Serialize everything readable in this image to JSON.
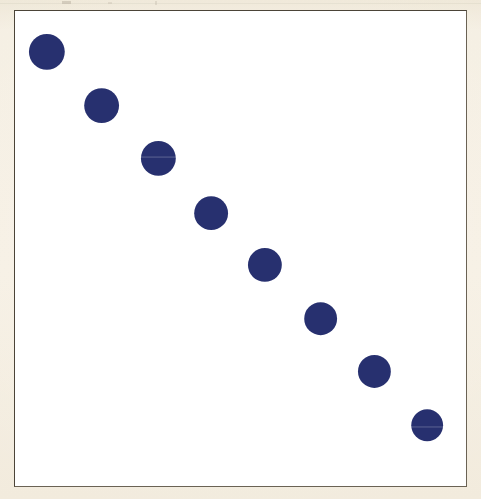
{
  "page": {
    "background_color": "#f5efe3",
    "artifact_color": "#b9b1a0"
  },
  "figure": {
    "frame_color": "#4b4438",
    "panel_color": "#ffffff",
    "frame": {
      "x": 14,
      "y": 10,
      "width": 453,
      "height": 477
    }
  },
  "chart_data": {
    "type": "scatter",
    "title": "",
    "subtitle": "",
    "xlabel": "",
    "ylabel": "",
    "xlim": [
      0,
      100
    ],
    "ylim": [
      0,
      100
    ],
    "grid": false,
    "legend": false,
    "legend_position": "none",
    "tick_labels_x": [],
    "tick_labels_y": [],
    "annotations": [],
    "marker": {
      "shape": "circle",
      "color": "#27306f",
      "edge_color": "#27306f",
      "opacity": 1
    },
    "series": [
      {
        "name": "series-1",
        "color": "#27306f",
        "x": [
          7.1,
          19.2,
          31.8,
          43.5,
          55.4,
          67.8,
          79.7,
          91.4
        ],
        "y": [
          91.4,
          80.1,
          68.9,
          57.4,
          46.5,
          35.2,
          24.1,
          12.4
        ],
        "marker_sizes_px": [
          36,
          35,
          35,
          34,
          34,
          33,
          33,
          32
        ],
        "points": [
          {
            "index": 1,
            "x": 7.1,
            "y": 91.4,
            "px": 46,
            "py": 51,
            "d": 36
          },
          {
            "index": 2,
            "x": 19.2,
            "y": 80.1,
            "px": 101,
            "py": 105,
            "d": 35
          },
          {
            "index": 3,
            "x": 31.8,
            "y": 68.9,
            "px": 158,
            "py": 158,
            "d": 35
          },
          {
            "index": 4,
            "x": 43.5,
            "y": 57.4,
            "px": 211,
            "py": 213,
            "d": 34
          },
          {
            "index": 5,
            "x": 55.4,
            "y": 46.5,
            "px": 265,
            "py": 265,
            "d": 34
          },
          {
            "index": 6,
            "x": 67.8,
            "y": 35.2,
            "px": 321,
            "py": 319,
            "d": 33
          },
          {
            "index": 7,
            "x": 79.7,
            "y": 24.1,
            "px": 375,
            "py": 372,
            "d": 33
          },
          {
            "index": 8,
            "x": 91.4,
            "y": 12.4,
            "px": 428,
            "py": 426,
            "d": 32
          }
        ]
      }
    ]
  }
}
